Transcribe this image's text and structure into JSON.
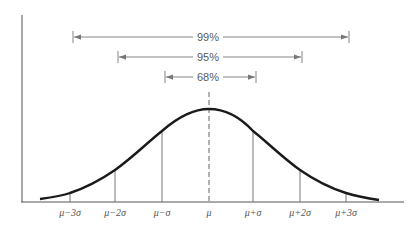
{
  "diagram": {
    "intervals": [
      {
        "label": "99%",
        "from": "μ−3σ",
        "to": "μ+3σ"
      },
      {
        "label": "95%",
        "from": "μ−2σ",
        "to": "μ+2σ"
      },
      {
        "label": "68%",
        "from": "μ−σ",
        "to": "μ+σ"
      }
    ],
    "x_ticks": [
      "μ−3σ",
      "μ−2σ",
      "μ−σ",
      "μ",
      "μ+σ",
      "μ+2σ",
      "μ+3σ"
    ]
  },
  "colors": {
    "curve": "#1a1a1a",
    "axis": "#555555",
    "arrow": "#777777",
    "background": "#ffffff"
  }
}
